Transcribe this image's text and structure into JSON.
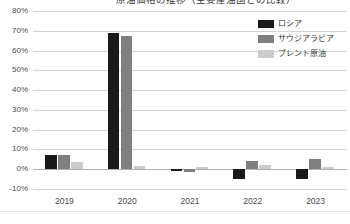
{
  "chart_data": {
    "type": "bar",
    "title": "原油価格の推移（主要産油国との比較）",
    "xlabel": "",
    "ylabel": "",
    "categories": [
      "2019",
      "2020",
      "2021",
      "2022",
      "2023"
    ],
    "series": [
      {
        "name": "ロシア",
        "color": "#1a1a1a",
        "values": [
          7,
          69,
          -1,
          -5,
          -5
        ]
      },
      {
        "name": "サウジアラビア",
        "color": "#808080",
        "values": [
          7,
          67.5,
          -1.5,
          4,
          5
        ]
      },
      {
        "name": "ブレント原油",
        "color": "#cccccc",
        "values": [
          3.5,
          1.5,
          1,
          2,
          1
        ]
      }
    ],
    "ylim": [
      -10,
      80
    ],
    "ytick_step": 10,
    "ytick_labels": [
      "80%",
      "70%",
      "60%",
      "50%",
      "40%",
      "30%",
      "20%",
      "10%",
      "0%",
      "-10%"
    ],
    "ytick_values": [
      80,
      70,
      60,
      50,
      40,
      30,
      20,
      10,
      0,
      -10
    ],
    "grid": true,
    "legend_position": "top-right"
  },
  "legend": {
    "items": [
      {
        "label": "ロシア",
        "color": "#1a1a1a"
      },
      {
        "label": "サウジアラビア",
        "color": "#808080"
      },
      {
        "label": "ブレント原油",
        "color": "#cccccc"
      }
    ]
  }
}
